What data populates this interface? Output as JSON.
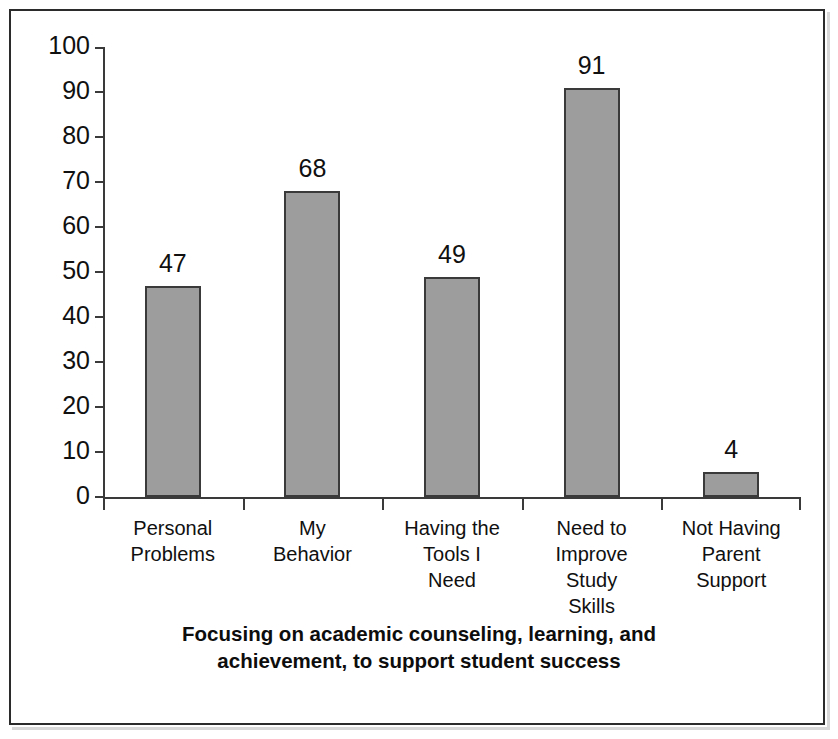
{
  "chart_data": {
    "type": "bar",
    "title_line1": "Focusing on academic counseling, learning, and",
    "title_line2": "achievement, to support student success",
    "xlabel": "",
    "ylabel": "",
    "ylim": [
      0,
      100
    ],
    "ytick_step": 10,
    "grid": false,
    "legend": false,
    "categories": [
      "Personal\nProblems",
      "My\nBehavior",
      "Having the\nTools I\nNeed",
      "Need to\nImprove\nStudy\nSkills",
      "Not Having\nParent\nSupport"
    ],
    "values": [
      47,
      68,
      49,
      91,
      4
    ],
    "bar_plotted_heights": [
      47,
      68,
      49,
      91,
      5.5
    ],
    "data_labels": [
      "47",
      "68",
      "49",
      "91",
      "4"
    ],
    "ytick_labels": [
      "100",
      "90",
      "80",
      "70",
      "60",
      "50",
      "40",
      "30",
      "20",
      "10",
      "0"
    ],
    "ytick_values": [
      100,
      90,
      80,
      70,
      60,
      50,
      40,
      30,
      20,
      10,
      0
    ],
    "colors": {
      "bar_fill": "#9d9d9d",
      "bar_border": "#3a3a3a",
      "axis": "#3a3a3a",
      "text": "#101010",
      "frame": "#2b2b2b",
      "background": "#ffffff"
    }
  }
}
